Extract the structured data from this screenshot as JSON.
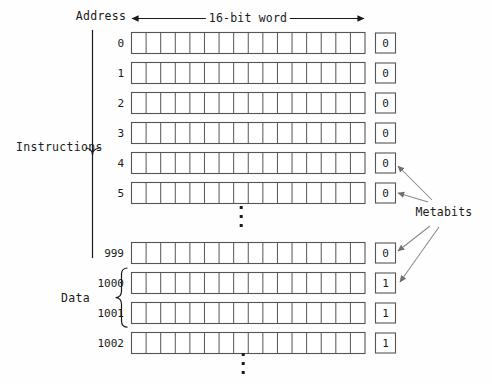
{
  "diagram": {
    "title_top": "16-bit word",
    "address_header": "Address",
    "group_labels": {
      "instructions": "Instructions",
      "data": "Data"
    },
    "metabits_label": "Metabits",
    "word_bit_count": 16,
    "ellipsis_glyph": "vertical-ellipsis",
    "colors": {
      "ink": "#1a1a1a",
      "cell_stroke": "#555555",
      "background": "#fefefe",
      "arrow": "#7a7a7a"
    },
    "rows": [
      {
        "address": "0",
        "metabit": "0",
        "group": "instructions",
        "y": 43
      },
      {
        "address": "1",
        "metabit": "0",
        "group": "instructions",
        "y": 73
      },
      {
        "address": "2",
        "metabit": "0",
        "group": "instructions",
        "y": 103
      },
      {
        "address": "3",
        "metabit": "0",
        "group": "instructions",
        "y": 133
      },
      {
        "address": "4",
        "metabit": "0",
        "group": "instructions",
        "y": 163
      },
      {
        "address": "5",
        "metabit": "0",
        "group": "instructions",
        "y": 193
      },
      {
        "address": "999",
        "metabit": "0",
        "group": "instructions",
        "y": 253
      },
      {
        "address": "1000",
        "metabit": "1",
        "group": "data",
        "y": 283
      },
      {
        "address": "1001",
        "metabit": "1",
        "group": "data",
        "y": 313
      },
      {
        "address": "1002",
        "metabit": "1",
        "group": "data",
        "y": 343
      }
    ],
    "ellipses": [
      {
        "name": "instructions-gap-ellipsis",
        "x": 241,
        "y": 206
      },
      {
        "name": "below-data-ellipsis",
        "x": 243,
        "y": 353
      }
    ],
    "arrows_from_metabits": [
      {
        "target_address": "4"
      },
      {
        "target_address": "5"
      },
      {
        "target_address": "999"
      },
      {
        "target_address": "1000"
      }
    ]
  }
}
